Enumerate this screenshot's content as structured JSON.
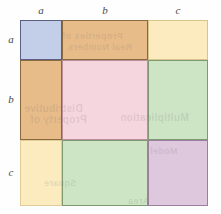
{
  "diagram": {
    "type": "area-model-grid",
    "rows": 3,
    "columns": 3,
    "geometry": {
      "grid_left": 20,
      "grid_top": 20,
      "grid_width": 188,
      "grid_height": 186,
      "column_widths": [
        42,
        86,
        60
      ],
      "row_heights": [
        40,
        80,
        66
      ]
    },
    "column_labels": [
      {
        "text": "a",
        "center_x": 41
      },
      {
        "text": "b",
        "center_x": 105
      },
      {
        "text": "c",
        "center_x": 178
      }
    ],
    "row_labels": [
      {
        "text": "a",
        "center_y": 40
      },
      {
        "text": "b",
        "center_y": 100
      },
      {
        "text": "c",
        "center_y": 173
      }
    ],
    "cells": [
      {
        "name": "cell-a-a",
        "row": 0,
        "col": 0,
        "product": "a·a",
        "fill": "#c3cfe9",
        "border": "#5b5f86"
      },
      {
        "name": "cell-a-b",
        "row": 0,
        "col": 1,
        "product": "a·b",
        "fill": "#e8bc89",
        "border": "#8a6a3d"
      },
      {
        "name": "cell-a-c",
        "row": 0,
        "col": 2,
        "product": "a·c",
        "fill": "#fbebbf",
        "border": "#d8c58e"
      },
      {
        "name": "cell-b-a",
        "row": 1,
        "col": 0,
        "product": "b·a",
        "fill": "#e8bc89",
        "border": "#8a6a3d"
      },
      {
        "name": "cell-b-b",
        "row": 1,
        "col": 1,
        "product": "b·b",
        "fill": "#f6d6de",
        "border": "#b98f9c"
      },
      {
        "name": "cell-b-c",
        "row": 1,
        "col": 2,
        "product": "b·c",
        "fill": "#cde5c4",
        "border": "#7e9a72"
      },
      {
        "name": "cell-c-a",
        "row": 2,
        "col": 0,
        "product": "c·a",
        "fill": "#fbebbf",
        "border": "#dfcd99"
      },
      {
        "name": "cell-c-b",
        "row": 2,
        "col": 1,
        "product": "c·b",
        "fill": "#cde5c4",
        "border": "#7e9a72"
      },
      {
        "name": "cell-c-c",
        "row": 2,
        "col": 2,
        "product": "c·c",
        "fill": "#ddc8de",
        "border": "#9b7f9d"
      }
    ],
    "background": "#fefefe"
  },
  "bleed_through": {
    "note": "Faint mirrored text showing through from the opposite side of the printed page.",
    "lines": [
      "Properties of",
      "Real Numbers",
      "Distributive",
      "Property of",
      "Multiplication",
      "Square",
      "Area",
      "Model"
    ]
  }
}
